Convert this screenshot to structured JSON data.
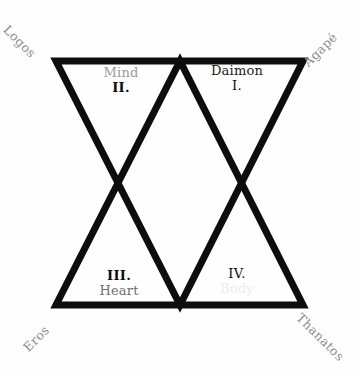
{
  "diagram": {
    "background_color": "#fefefe",
    "stroke_color": "#0d0d0d",
    "stroke_width": 7,
    "corner_labels": [
      {
        "id": "logos",
        "text": "Logos",
        "position": "top-left",
        "rotation_deg": 45,
        "color": "#8d8d8d"
      },
      {
        "id": "agape",
        "text": "Agapé",
        "position": "top-right",
        "rotation_deg": -45,
        "color": "#8d8d8d"
      },
      {
        "id": "eros",
        "text": "Eros",
        "position": "bottom-left",
        "rotation_deg": -45,
        "color": "#8d8d8d"
      },
      {
        "id": "thanatos",
        "text": "Thanatos",
        "position": "bottom-right",
        "rotation_deg": 45,
        "color": "#8d8d8d"
      }
    ],
    "quadrants": [
      {
        "id": "i",
        "numeral": "I.",
        "word": "Daimon",
        "position": "top-right",
        "word_color": "#1b1b1b",
        "order": "word-above-numeral"
      },
      {
        "id": "ii",
        "numeral": "II.",
        "word": "Mind",
        "position": "top-left",
        "word_color": "#9a9a9a",
        "order": "word-above-numeral"
      },
      {
        "id": "iii",
        "numeral": "III.",
        "word": "Heart",
        "position": "bottom-left",
        "word_color": "#6f6f6f",
        "order": "numeral-above-word"
      },
      {
        "id": "iv",
        "numeral": "IV.",
        "word": "Body",
        "position": "bottom-right",
        "word_color": "#ededed",
        "order": "numeral-above-word"
      }
    ],
    "geometry": {
      "down_triangle": "56,61 303,61 180,305",
      "up_triangle": "56,305 303,305 180,61",
      "vertices": {
        "top_left": [
          56,
          61
        ],
        "top_mid": [
          180,
          61
        ],
        "top_right": [
          303,
          61
        ],
        "bottom_left": [
          56,
          305
        ],
        "bottom_mid": [
          180,
          305
        ],
        "bottom_right": [
          303,
          305
        ],
        "left_crossing": [
          118,
          183
        ],
        "right_crossing": [
          240,
          183
        ]
      }
    }
  }
}
